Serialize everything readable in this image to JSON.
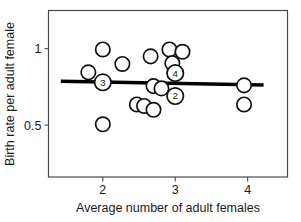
{
  "chart_data": {
    "type": "scatter",
    "title": "",
    "xlabel": "Average number of adult females",
    "ylabel": "Birth rate per adult female",
    "xlim": [
      1.25,
      4.55
    ],
    "ylim": [
      0.16,
      1.25
    ],
    "xticks": [
      2,
      3,
      4
    ],
    "xticklabels": [
      "2",
      "3",
      "4"
    ],
    "yticks": [
      1,
      0.5
    ],
    "yticklabels": [
      "1",
      "0.5"
    ],
    "grid": false,
    "legend": null,
    "marker": "open-circle",
    "points": [
      {
        "x": 1.8,
        "y": 0.845,
        "label": null
      },
      {
        "x": 2.0,
        "y": 0.995,
        "label": null
      },
      {
        "x": 2.0,
        "y": 0.78,
        "label": "3"
      },
      {
        "x": 2.0,
        "y": 0.505,
        "label": null
      },
      {
        "x": 2.27,
        "y": 0.9,
        "label": null
      },
      {
        "x": 2.47,
        "y": 0.635,
        "label": null
      },
      {
        "x": 2.57,
        "y": 0.625,
        "label": null
      },
      {
        "x": 2.66,
        "y": 0.95,
        "label": null
      },
      {
        "x": 2.7,
        "y": 0.6,
        "label": null
      },
      {
        "x": 2.7,
        "y": 0.755,
        "label": null
      },
      {
        "x": 2.81,
        "y": 0.74,
        "label": null
      },
      {
        "x": 2.92,
        "y": 0.995,
        "label": null
      },
      {
        "x": 2.96,
        "y": 0.905,
        "label": null
      },
      {
        "x": 3.0,
        "y": 0.84,
        "label": "4"
      },
      {
        "x": 3.0,
        "y": 0.69,
        "label": "2"
      },
      {
        "x": 3.1,
        "y": 0.98,
        "label": null
      },
      {
        "x": 3.95,
        "y": 0.76,
        "label": null
      },
      {
        "x": 3.95,
        "y": 0.635,
        "label": null
      }
    ],
    "trendline": {
      "x_start": 1.42,
      "y_start": 0.787,
      "x_end": 4.22,
      "y_end": 0.762
    },
    "colors": {
      "marker_stroke": "#111111",
      "marker_fill": "#ffffff",
      "trendline": "#000000",
      "axis": "#4a4a4a",
      "text": "#1a1a1a"
    }
  }
}
